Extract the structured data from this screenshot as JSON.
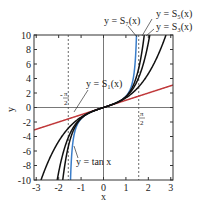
{
  "chart_data": {
    "type": "line",
    "title": "",
    "xlabel": "x",
    "ylabel": "y",
    "xlim": [
      -3.1,
      3.1
    ],
    "ylim": [
      -10,
      10
    ],
    "xticks": [
      "-3",
      "-2",
      "-1",
      "0",
      "1",
      "2",
      "3"
    ],
    "yticks": [
      "10",
      "8",
      "6",
      "4",
      "2",
      "0",
      "-2",
      "-4",
      "-6",
      "-8",
      "-10"
    ],
    "grid": false,
    "series": [
      {
        "name": "y = tan x",
        "color": "#3a7dc9",
        "func": "tan"
      },
      {
        "name": "y = S1(x)",
        "color": "#c0393b",
        "func": "S1",
        "points": [
          [
            -3,
            -3
          ],
          [
            3,
            3
          ]
        ]
      },
      {
        "name": "y = S3(x)",
        "color": "#111111",
        "func": "S3"
      },
      {
        "name": "y = S5(x)",
        "color": "#111111",
        "func": "S5"
      },
      {
        "name": "y = S7(x)",
        "color": "#111111",
        "func": "S7"
      }
    ],
    "annotations": {
      "asymptotes": [
        "-π/2",
        "π/2"
      ],
      "labels": {
        "s7": "y = S₇(x)",
        "s5": "y = S₅(x)",
        "s3": "y = S₃(x)",
        "s1": "y = S₁(x)",
        "tan": "y = tan x",
        "neg_pi_over_2_num": "π",
        "neg_pi_over_2_sign": "-",
        "pi_over_2_num": "π",
        "half_den": "2"
      }
    }
  }
}
